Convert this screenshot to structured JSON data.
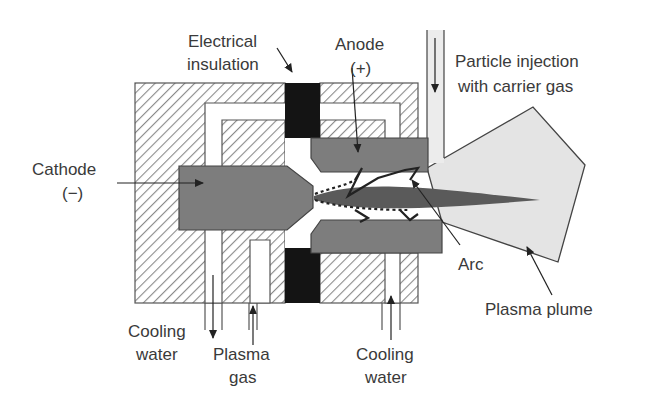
{
  "labels": {
    "electrical_insulation": [
      "Electrical",
      "insulation"
    ],
    "anode": [
      "Anode",
      "(+)"
    ],
    "particle_injection": [
      "Particle injection",
      "with carrier gas"
    ],
    "cathode": [
      "Cathode",
      "(−)"
    ],
    "arc": "Arc",
    "plasma_plume": "Plasma plume",
    "cooling_water_left": [
      "Cooling",
      "water"
    ],
    "plasma_gas": [
      "Plasma",
      "gas"
    ],
    "cooling_water_right": [
      "Cooling",
      "water"
    ]
  },
  "colors": {
    "housing_hatch": "#8a8a8a",
    "electrode_fill": "#7d7d7d",
    "insulation_fill": "#141414",
    "plume_fill": "#e4e4e4",
    "jet_fill": "#5a5a5a",
    "outline": "#444444"
  }
}
